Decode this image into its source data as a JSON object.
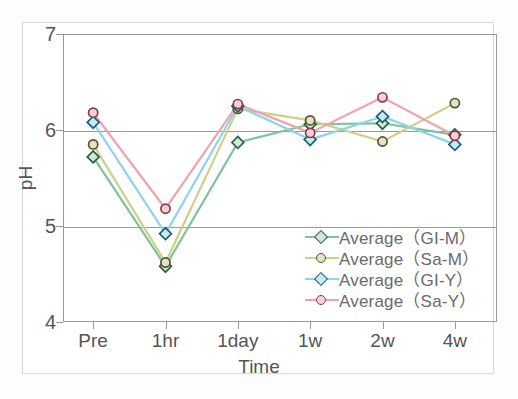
{
  "chart_data": {
    "type": "line",
    "title": "",
    "xlabel": "Time",
    "ylabel": "pH",
    "categories": [
      "Pre",
      "1hr",
      "1day",
      "1w",
      "2w",
      "4w"
    ],
    "ylim": [
      4,
      7
    ],
    "yticks": [
      4,
      5,
      6,
      7
    ],
    "grid": "horizontal gridlines at pH 5 and 6",
    "legend_position": "inside lower-right",
    "series": [
      {
        "name": "Average（GI-M）",
        "marker": "diamond",
        "color": "#7cc49b",
        "marker_fill": "#cfe8da",
        "marker_edge": "#2f5f46",
        "values": [
          5.72,
          4.58,
          5.87,
          6.06,
          6.07,
          5.95
        ]
      },
      {
        "name": "Average（Sa-M）",
        "marker": "circle",
        "color": "#cdd089",
        "marker_fill": "#e4e4c4",
        "marker_edge": "#53542c",
        "values": [
          5.85,
          4.62,
          6.22,
          6.1,
          5.88,
          6.28
        ]
      },
      {
        "name": "Average（GI-Y）",
        "marker": "diamond",
        "color": "#8ed3ea",
        "marker_fill": "#c6e9f5",
        "marker_edge": "#1d5f76",
        "values": [
          6.08,
          4.92,
          6.25,
          5.9,
          6.14,
          5.85
        ]
      },
      {
        "name": "Average（Sa-Y）",
        "marker": "circle",
        "color": "#f0a3ae",
        "marker_fill": "#f7cfd6",
        "marker_edge": "#8c3a48",
        "values": [
          6.18,
          5.18,
          6.27,
          5.97,
          6.34,
          5.94
        ]
      }
    ]
  },
  "axes": {
    "y_tick_labels": [
      "7",
      "6",
      "5",
      "4"
    ],
    "x_tick_labels": [
      "Pre",
      "1hr",
      "1day",
      "1w",
      "2w",
      "4w"
    ],
    "y_title": "pH",
    "x_title": "Time"
  },
  "legend": {
    "entries": [
      {
        "label": "Average（GI-M）"
      },
      {
        "label": "Average（Sa-M）"
      },
      {
        "label": "Average（GI-Y）"
      },
      {
        "label": "Average（Sa-Y）"
      }
    ]
  },
  "colors": {
    "axis": "#9a9a9a",
    "text": "#555555",
    "frame": "#d9d9d9",
    "background": "#ffffff"
  }
}
